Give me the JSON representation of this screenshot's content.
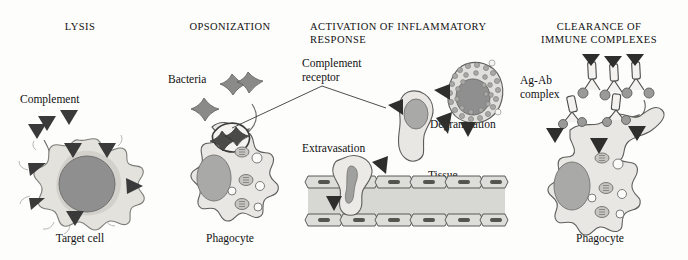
{
  "figure": {
    "kind": "immunology-diagram",
    "title_font_case": "upper",
    "background": "#fdfdfc",
    "ink": "#1a1a1a"
  },
  "palette": {
    "cytoplasm": "#e8e7e3",
    "cytoplasm_edge": "#5d5d5a",
    "nucleus": "#8f8f8f",
    "nucleus_edge": "#6b6b6b",
    "granule": "#a8a8a6",
    "complement_dark": "#3a3a3a",
    "vessel_lumen": "#d7d7d4",
    "endothelium": "#ddddd9",
    "bacteria": "#8a8a88",
    "antigen": "#9a9a98",
    "debris": "#c9c8c3"
  },
  "panels": [
    {
      "id": "lysis",
      "title": "LYSIS",
      "labels": [
        {
          "name": "complement",
          "text": "Complement"
        }
      ],
      "caption": "Target cell",
      "elements": {
        "free_complement_count": 3,
        "membrane_complement_count": 6,
        "arrow": "curved-down"
      }
    },
    {
      "id": "opsonization",
      "title": "OPSONIZATION",
      "labels": [
        {
          "name": "bacteria",
          "text": "Bacteria"
        }
      ],
      "caption": "Phagocyte",
      "elements": {
        "bacteria_count": 3,
        "engulfed_bacteria_count": 2,
        "vesicle_count": 4,
        "granule_count": 3,
        "arrow": "curved-down-right"
      }
    },
    {
      "id": "activation",
      "title": "ACTIVATION OF INFLAMMATORY\nRESPONSE",
      "labels": [
        {
          "name": "complement-receptor",
          "text": "Complement\nreceptor"
        },
        {
          "name": "degranulation",
          "text": "Degranulation"
        },
        {
          "name": "extravasation",
          "text": "Extravasation"
        },
        {
          "name": "tissue",
          "text": "Tissue"
        },
        {
          "name": "blood",
          "text": "Blood"
        }
      ],
      "caption": "",
      "elements": {
        "receptor_count_on_activated_cell": 2,
        "receptor_count_on_degranulating_cell": 2,
        "granule_count": 34,
        "endothelial_cells_top": 6,
        "endothelial_cells_bottom": 6,
        "extravasation_receptors": 2
      }
    },
    {
      "id": "clearance",
      "title": "CLEARANCE OF\nIMMUNE COMPLEXES",
      "labels": [
        {
          "name": "ag-ab-complex",
          "text": "Ag-Ab\ncomplex"
        }
      ],
      "caption": "Phagocyte",
      "elements": {
        "antibody_count": 3,
        "antigen_count": 5,
        "complement_triangle_count": 3,
        "bound_receptor_count": 3,
        "vesicle_count": 4,
        "granule_count": 3,
        "arrow": "curved-down"
      }
    }
  ]
}
